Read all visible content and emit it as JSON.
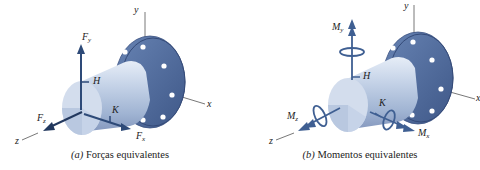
{
  "colors": {
    "flange": "#4f6c9e",
    "flange_dark": "#3d5686",
    "cylinder_light": "#dfe7f3",
    "cylinder_mid": "#b3c3dc",
    "cylinder_dark": "#8ea3c6",
    "end_face": "#cfdaeb",
    "end_face_dark": "#b9c8e0",
    "force_arrow": "#2e4a78",
    "moment_arrow": "#3f5f92",
    "axis_line": "#555555",
    "bolt_hole": "#ffffff"
  },
  "panels": [
    {
      "id": "a",
      "caption_prefix": "(a)",
      "caption_text": " Forças equivalentes",
      "labels": {
        "y_axis": "y",
        "x_axis": "x",
        "z_axis": "z",
        "point_h": "H",
        "point_k": "K",
        "fy_main": "F",
        "fy_sub": "y",
        "fz_main": "F",
        "fz_sub": "z",
        "fx_main": "F",
        "fx_sub": "x"
      }
    },
    {
      "id": "b",
      "caption_prefix": "(b)",
      "caption_text": " Momentos equivalentes",
      "labels": {
        "y_axis": "y",
        "x_axis": "x",
        "z_axis": "z",
        "point_h": "H",
        "point_k": "K",
        "my_main": "M",
        "my_sub": "y",
        "mz_main": "M",
        "mz_sub": "z",
        "mx_main": "M",
        "mx_sub": "x"
      }
    }
  ]
}
